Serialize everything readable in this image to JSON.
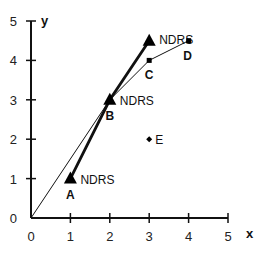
{
  "chart_data": {
    "type": "line",
    "title": "",
    "xlabel": "x",
    "ylabel": "y",
    "xlim": [
      0,
      5
    ],
    "ylim": [
      0,
      5
    ],
    "xticks": [
      "0",
      "1",
      "2",
      "3",
      "4",
      "5"
    ],
    "yticks": [
      "0",
      "1",
      "2",
      "3",
      "4",
      "5"
    ],
    "grid": false,
    "series": [
      {
        "name": "thick-triangle-line",
        "marker": "triangle",
        "points": [
          {
            "x": 1,
            "y": 1,
            "label": "A",
            "annotation": "NDRS"
          },
          {
            "x": 2,
            "y": 3,
            "label": "B",
            "annotation": "NDRS"
          },
          {
            "x": 3,
            "y": 4.5,
            "label": "",
            "annotation": "NDRS"
          }
        ]
      },
      {
        "name": "thin-square-line",
        "marker": "square",
        "points": [
          {
            "x": 0,
            "y": 0,
            "label": ""
          },
          {
            "x": 2,
            "y": 3,
            "label": ""
          },
          {
            "x": 3,
            "y": 4,
            "label": "C"
          },
          {
            "x": 4,
            "y": 4.5,
            "label": "D"
          }
        ]
      },
      {
        "name": "point-E",
        "marker": "diamond",
        "points": [
          {
            "x": 3,
            "y": 2,
            "label": "E"
          }
        ]
      }
    ]
  }
}
